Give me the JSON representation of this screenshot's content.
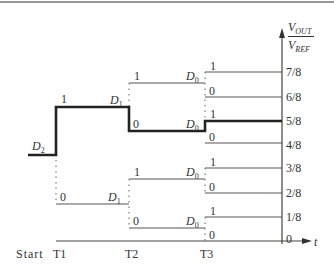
{
  "diagram": {
    "type": "sar-dac-binary-search-timing",
    "y_axis": {
      "label_num": "V",
      "label_num_sub": "OUT",
      "label_den": "V",
      "label_den_sub": "REF"
    },
    "x_axis": {
      "label": "t"
    },
    "levels": [
      "7/8",
      "6/8",
      "5/8",
      "4/8",
      "3/8",
      "2/8",
      "1/8",
      "0"
    ],
    "time_labels": [
      "Start",
      "T1",
      "T2",
      "T3"
    ],
    "bits": {
      "d2": {
        "sym": "D",
        "sub": "2"
      },
      "d1": {
        "sym": "D",
        "sub": "1"
      },
      "d0": {
        "sym": "D",
        "sub": "0"
      }
    },
    "branch_labels": {
      "one": "1",
      "zero": "0"
    },
    "selected_path": [
      "1",
      "0",
      "1"
    ],
    "result_level": "5/8"
  }
}
